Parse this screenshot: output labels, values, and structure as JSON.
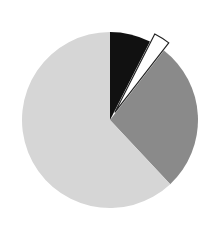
{
  "chart_data": {
    "type": "pie",
    "title": "",
    "categories": [
      "Slice A",
      "Slice B",
      "Slice C",
      "Slice D"
    ],
    "values": [
      7.5,
      3,
      27.5,
      62
    ],
    "colors": [
      "#111111",
      "#ffffff",
      "#8a8a8a",
      "#d6d6d6"
    ],
    "exploded": [
      false,
      true,
      false,
      false
    ],
    "start_angle_deg": 0,
    "direction": "clockwise",
    "legend": null,
    "labels_shown": false
  },
  "layout": {
    "cx": 110,
    "cy": 120,
    "r": 88,
    "explode_offset": 9
  }
}
